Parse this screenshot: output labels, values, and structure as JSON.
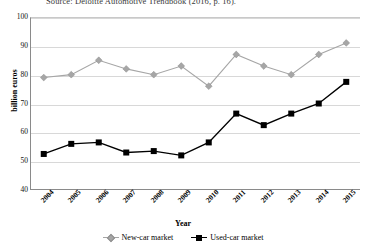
{
  "figure": {
    "source_caption": "Source: Deloitte Automotive Trendbook (2016, p. 16).",
    "colors": {
      "new_car": "#a6a6a6",
      "used_car": "#000000",
      "grid": "#d8d8d8",
      "axis": "#8a8a8a",
      "background": "#ffffff"
    }
  },
  "chart_data": {
    "type": "line",
    "title": "",
    "subtitle": "",
    "xlabel": "Year",
    "ylabel": "billion euros",
    "categories": [
      "2004",
      "2005",
      "2006",
      "2007",
      "2008",
      "2009",
      "2010",
      "2011",
      "2012",
      "2013",
      "2014",
      "2015"
    ],
    "x": [
      2004,
      2005,
      2006,
      2007,
      2008,
      2009,
      2010,
      2011,
      2012,
      2013,
      2014,
      2015
    ],
    "series": [
      {
        "name": "New-car market",
        "marker": "diamond",
        "color": "#a6a6a6",
        "values": [
          79,
          80,
          85,
          82,
          80,
          83,
          76,
          87,
          83,
          80,
          87,
          91
        ]
      },
      {
        "name": "Used-car market",
        "marker": "square",
        "color": "#000000",
        "values": [
          52.5,
          56,
          56.5,
          53,
          53.5,
          52,
          56.5,
          66.5,
          62.5,
          66.5,
          70,
          77.5
        ]
      }
    ],
    "ylim": [
      40,
      100
    ],
    "yticks": [
      40,
      50,
      60,
      70,
      80,
      90,
      100
    ],
    "ytick_labels": [
      "40",
      "50",
      "60",
      "70",
      "80",
      "90",
      "100"
    ],
    "grid": true,
    "grid_axis": "y",
    "legend_position": "bottom",
    "legend": [
      "New-car market",
      "Used-car market"
    ]
  }
}
